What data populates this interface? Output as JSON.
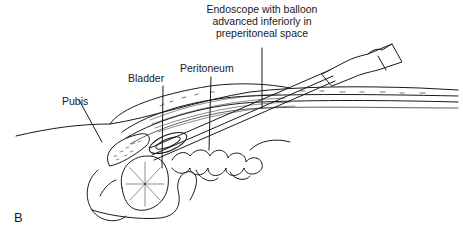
{
  "diagram": {
    "panel_label": "B",
    "labels": {
      "endoscope": [
        "Endoscope with balloon",
        "advanced inferiorly in",
        "preperitoneal space"
      ],
      "peritoneum": "Peritoneum",
      "bladder": "Bladder",
      "pubis": "Pubis"
    },
    "colors": {
      "line": "#1a1a1a",
      "background": "#ffffff"
    }
  }
}
